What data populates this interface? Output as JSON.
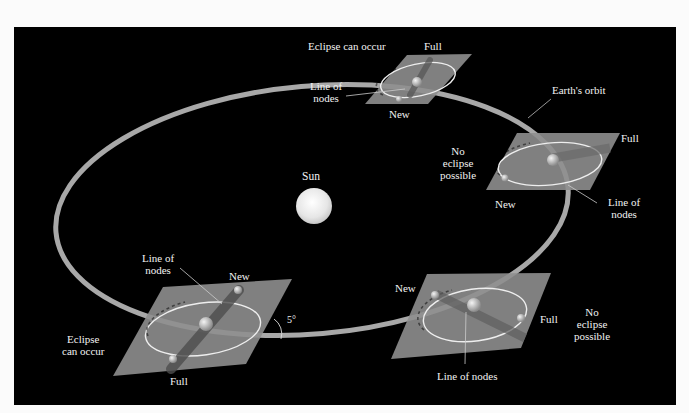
{
  "figure": {
    "background": "#000000",
    "orbit_color": "#a8a8a8",
    "plane_color": "#8e8e8e",
    "sun_label": "Sun",
    "orbit_label": "Earth's orbit",
    "angle_label": "5°"
  },
  "positions": [
    {
      "id": "top",
      "condition": "Eclipse can occur",
      "full": "Full",
      "new": "New",
      "nodes": "Line of nodes",
      "nodes_l1": "Line of",
      "nodes_l2": "nodes"
    },
    {
      "id": "right",
      "condition_l1": "No",
      "condition_l2": "eclipse",
      "condition_l3": "possible",
      "full": "Full",
      "new": "New",
      "nodes_l1": "Line of",
      "nodes_l2": "nodes"
    },
    {
      "id": "bottom-right",
      "condition_l1": "No",
      "condition_l2": "eclipse",
      "condition_l3": "possible",
      "full": "Full",
      "new": "New",
      "nodes": "Line of nodes"
    },
    {
      "id": "bottom-left",
      "condition_l1": "Eclipse",
      "condition_l2": "can occur",
      "full": "Full",
      "new": "New",
      "nodes_l1": "Line of",
      "nodes_l2": "nodes"
    }
  ]
}
